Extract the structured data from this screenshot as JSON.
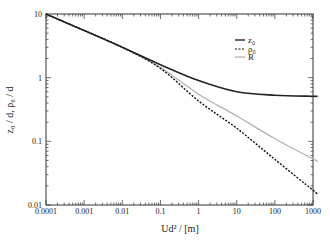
{
  "chart_data": {
    "type": "line",
    "title": "",
    "xlabel": "Ud² / [m]",
    "ylabel": "z₀ / d, ρ₀ / d",
    "xscale": "log",
    "yscale": "log",
    "xlim": [
      0.0001,
      1300
    ],
    "ylim": [
      0.01,
      10
    ],
    "x_ticks": [
      "0.0001",
      "0.001",
      "0.01",
      "0.1",
      "1",
      "10",
      "100",
      "1000"
    ],
    "y_ticks": [
      "0.01",
      "0.1",
      "1",
      "10"
    ],
    "grid": false,
    "legend_position": "upper right",
    "x": [
      0.0001,
      0.001,
      0.01,
      0.1,
      1,
      10,
      100,
      1000,
      1300
    ],
    "series": [
      {
        "name": "z₀",
        "style": "solid",
        "color": "#222222",
        "width": 1.6,
        "values": [
          10,
          5.5,
          3.0,
          1.6,
          0.9,
          0.6,
          0.53,
          0.51,
          0.51
        ]
      },
      {
        "name": "ρ₀",
        "style": "dashed",
        "color": "#111111",
        "width": 1.4,
        "values": [
          10,
          5.5,
          3.0,
          1.4,
          0.43,
          0.16,
          0.052,
          0.017,
          0.015
        ]
      },
      {
        "name": "R",
        "style": "solid",
        "color": "#b0b0b0",
        "width": 1.2,
        "values": [
          10,
          5.5,
          3.0,
          1.45,
          0.55,
          0.25,
          0.11,
          0.053,
          0.048
        ]
      }
    ]
  },
  "legend": {
    "items": [
      {
        "label": "z₀"
      },
      {
        "label": "ρ₀"
      },
      {
        "label": "R"
      }
    ]
  },
  "axes": {
    "xlabel": "Ud² / [m]",
    "ylabel": "z₀ / d, ρ₀ / d"
  }
}
